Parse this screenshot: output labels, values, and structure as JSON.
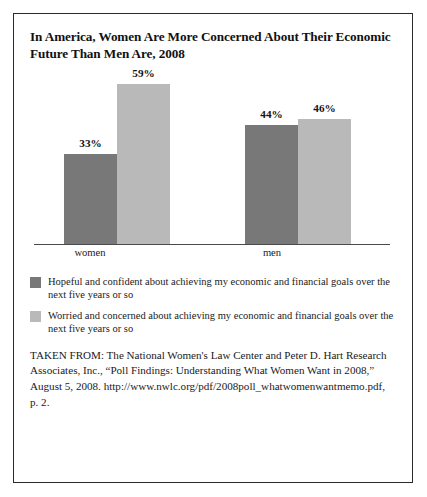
{
  "figure": {
    "title": "In America, Women Are More Concerned About Their Economic Future Than Men Are, 2008",
    "border_color": "#2b2b2b",
    "background": "#ffffff"
  },
  "chart_data": {
    "type": "bar",
    "title": "In America, Women Are More Concerned About Their Economic Future Than Men Are, 2008",
    "categories": [
      "women",
      "men"
    ],
    "series": [
      {
        "name": "Hopeful and confident about achieving my economic and financial goals over the next five years or so",
        "color": "#787878",
        "values": [
          33,
          59
        ],
        "value_labels": [
          "33%",
          "46%"
        ]
      },
      {
        "name": "Worried and concerned about achieving my economic and financial goals over the next five years or so",
        "color": "#b9b9b9",
        "values": [
          59,
          46
        ],
        "value_labels": [
          "59%",
          "46%"
        ]
      }
    ],
    "bars": [
      {
        "group": "women",
        "series": "hopeful",
        "value": 33,
        "label": "33%",
        "color": "#787878"
      },
      {
        "group": "women",
        "series": "worried",
        "value": 59,
        "label": "59%",
        "color": "#b9b9b9"
      },
      {
        "group": "men",
        "series": "hopeful",
        "value": 44,
        "label": "44%",
        "color": "#787878"
      },
      {
        "group": "men",
        "series": "worried",
        "value": 46,
        "label": "46%",
        "color": "#b9b9b9"
      }
    ],
    "xlabel": "",
    "ylabel": "",
    "ylim": [
      0,
      65
    ],
    "grid": false,
    "axis_visible": "x-baseline-only",
    "legend_position": "below",
    "units": "percent"
  },
  "legend": {
    "items": [
      {
        "swatch": "#787878",
        "text": "Hopeful and confident about achieving my economic and financial goals over the next five years or so"
      },
      {
        "swatch": "#b9b9b9",
        "text": "Worried and concerned about achieving my economic and financial goals over the next five years or so"
      }
    ]
  },
  "source": {
    "text": "TAKEN FROM: The National Women's Law Center and Peter D. Hart Research Associates, Inc., “Poll Findings: Understanding What Women Want in 2008,” August 5, 2008. http://www.nwlc.org/pdf/2008poll_whatwomenwantmemo.pdf, p. 2."
  }
}
